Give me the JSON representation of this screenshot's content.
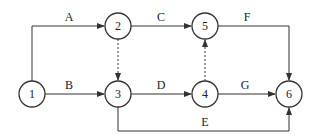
{
  "diagram": {
    "type": "activity-on-arrow network",
    "colors": {
      "line": "#333333",
      "background": "#ffffff"
    },
    "nodes": [
      {
        "id": "1",
        "label": "1",
        "x": 32,
        "y": 94
      },
      {
        "id": "2",
        "label": "2",
        "x": 118,
        "y": 26
      },
      {
        "id": "3",
        "label": "3",
        "x": 118,
        "y": 94
      },
      {
        "id": "4",
        "label": "4",
        "x": 205,
        "y": 94
      },
      {
        "id": "5",
        "label": "5",
        "x": 205,
        "y": 26
      },
      {
        "id": "6",
        "label": "6",
        "x": 289,
        "y": 94
      }
    ],
    "edges": [
      {
        "label": "A",
        "from": "1",
        "to": "2",
        "style": "solid"
      },
      {
        "label": "B",
        "from": "1",
        "to": "3",
        "style": "solid"
      },
      {
        "label": "C",
        "from": "2",
        "to": "5",
        "style": "solid"
      },
      {
        "label": "",
        "from": "2",
        "to": "3",
        "style": "dashed"
      },
      {
        "label": "D",
        "from": "3",
        "to": "4",
        "style": "solid"
      },
      {
        "label": "E",
        "from": "3",
        "to": "6",
        "style": "solid"
      },
      {
        "label": "",
        "from": "4",
        "to": "5",
        "style": "dashed"
      },
      {
        "label": "F",
        "from": "5",
        "to": "6",
        "style": "solid"
      },
      {
        "label": "G",
        "from": "4",
        "to": "6",
        "style": "solid"
      }
    ]
  }
}
